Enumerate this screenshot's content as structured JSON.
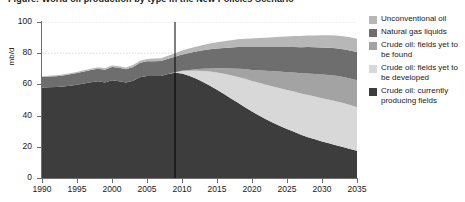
{
  "figure": {
    "title": "Figure: World oil production by type in the New Policies Scenario"
  },
  "axes": {
    "y_unit": "mb/d",
    "y_ticks": [
      0,
      20,
      40,
      60,
      80,
      100
    ],
    "x_ticks": [
      1990,
      1995,
      2000,
      2005,
      2010,
      2015,
      2020,
      2025,
      2030,
      2035
    ]
  },
  "legend": {
    "items": [
      {
        "label": "Unconventional oil",
        "color": "#b7b7b7",
        "swatch": "legend-swatch-unconventional-oil"
      },
      {
        "label": "Natural gas liquids",
        "color": "#6e6e6e",
        "swatch": "legend-swatch-natural-gas-liquids"
      },
      {
        "label": "Crude oil: fields yet to be found",
        "color": "#a3a3a3",
        "swatch": "legend-swatch-fields-yet-to-be-found"
      },
      {
        "label": "Crude oil: fields yet to be developed",
        "color": "#d8d8d8",
        "swatch": "legend-swatch-fields-yet-to-be-developed"
      },
      {
        "label": "Crude oil: currently producing fields",
        "color": "#3d3d3d",
        "swatch": "legend-swatch-currently-producing-fields"
      }
    ]
  },
  "divider": {
    "year": 2009,
    "color": "#000000"
  },
  "colors": {
    "grid": "#bfbfbf",
    "axis": "#6f6f6f",
    "background": "#ffffff"
  },
  "chart_data": {
    "type": "area",
    "title": "World oil production by type",
    "xlabel": "",
    "ylabel": "mb/d",
    "xlim": [
      1990,
      2035
    ],
    "ylim": [
      0,
      100
    ],
    "grid": true,
    "stacked": true,
    "legend_position": "right",
    "annotations": [
      {
        "type": "vline",
        "x": 2009,
        "note": "history / projection divider"
      }
    ],
    "x": [
      1990,
      1991,
      1992,
      1993,
      1994,
      1995,
      1996,
      1997,
      1998,
      1999,
      2000,
      2001,
      2002,
      2003,
      2004,
      2005,
      2006,
      2007,
      2008,
      2009,
      2010,
      2011,
      2012,
      2013,
      2014,
      2015,
      2016,
      2017,
      2018,
      2019,
      2020,
      2021,
      2022,
      2023,
      2024,
      2025,
      2026,
      2027,
      2028,
      2029,
      2030,
      2031,
      2032,
      2033,
      2034,
      2035
    ],
    "series": [
      {
        "name": "Crude oil: currently producing fields",
        "color": "#3d3d3d",
        "values": [
          58.0,
          58.2,
          58.3,
          58.6,
          59.2,
          59.8,
          60.6,
          61.4,
          62.0,
          61.2,
          62.6,
          62.0,
          61.2,
          62.4,
          64.6,
          65.4,
          65.4,
          65.4,
          66.6,
          67.4,
          67.0,
          65.6,
          63.8,
          61.6,
          59.2,
          56.6,
          53.8,
          51.0,
          48.2,
          45.4,
          42.6,
          40.0,
          37.6,
          35.4,
          33.4,
          31.4,
          29.6,
          27.8,
          26.2,
          24.8,
          23.4,
          22.2,
          21.0,
          19.8,
          18.6,
          17.4
        ]
      },
      {
        "name": "Crude oil: fields yet to be developed",
        "color": "#d8d8d8",
        "values": [
          0.0,
          0.0,
          0.0,
          0.0,
          0.0,
          0.0,
          0.0,
          0.0,
          0.0,
          0.0,
          0.0,
          0.0,
          0.0,
          0.0,
          0.0,
          0.0,
          0.0,
          0.0,
          0.0,
          0.4,
          1.6,
          3.2,
          5.0,
          7.0,
          9.0,
          11.0,
          13.0,
          14.8,
          16.6,
          18.2,
          19.6,
          21.0,
          22.2,
          23.2,
          24.2,
          25.0,
          25.8,
          26.4,
          27.0,
          27.4,
          27.8,
          28.0,
          28.2,
          28.2,
          28.2,
          28.0
        ]
      },
      {
        "name": "Crude oil: fields yet to be found",
        "color": "#a3a3a3",
        "values": [
          0.0,
          0.0,
          0.0,
          0.0,
          0.0,
          0.0,
          0.0,
          0.0,
          0.0,
          0.0,
          0.0,
          0.0,
          0.0,
          0.0,
          0.0,
          0.0,
          0.0,
          0.0,
          0.0,
          0.0,
          0.2,
          0.5,
          0.9,
          1.4,
          2.0,
          2.7,
          3.5,
          4.4,
          5.3,
          6.2,
          7.1,
          8.0,
          8.9,
          9.8,
          10.6,
          11.4,
          12.2,
          13.0,
          13.8,
          14.5,
          15.2,
          15.8,
          16.3,
          16.7,
          17.0,
          17.2
        ]
      },
      {
        "name": "Natural gas liquids",
        "color": "#6e6e6e",
        "values": [
          6.8,
          6.9,
          7.0,
          7.1,
          7.3,
          7.5,
          7.7,
          7.9,
          8.1,
          8.2,
          8.5,
          8.6,
          8.5,
          8.8,
          9.2,
          9.4,
          9.5,
          9.6,
          9.8,
          10.0,
          10.4,
          10.9,
          11.4,
          11.9,
          12.3,
          12.7,
          13.1,
          13.5,
          13.9,
          14.2,
          14.6,
          14.9,
          15.2,
          15.5,
          15.8,
          16.1,
          16.4,
          16.6,
          16.9,
          17.1,
          17.3,
          17.5,
          17.7,
          17.9,
          18.0,
          18.2
        ]
      },
      {
        "name": "Unconventional oil",
        "color": "#b7b7b7",
        "values": [
          0.5,
          0.5,
          0.6,
          0.6,
          0.7,
          0.7,
          0.8,
          0.8,
          0.9,
          0.9,
          1.0,
          1.1,
          1.2,
          1.3,
          1.4,
          1.5,
          1.7,
          1.8,
          2.0,
          2.2,
          2.5,
          2.8,
          3.1,
          3.4,
          3.7,
          4.0,
          4.3,
          4.6,
          4.9,
          5.2,
          5.5,
          5.8,
          6.0,
          6.3,
          6.5,
          6.8,
          7.0,
          7.2,
          7.4,
          7.6,
          7.8,
          8.0,
          8.1,
          8.3,
          8.4,
          8.5
        ]
      }
    ]
  }
}
